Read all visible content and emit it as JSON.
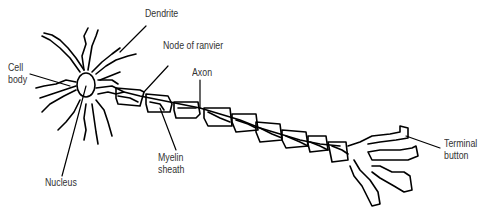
{
  "diagram": {
    "stroke_color": "#000000",
    "text_color": "#333333",
    "background": "#ffffff",
    "labels": {
      "dendrite": "Dendrite",
      "cell_body_line1": "Cell",
      "cell_body_line2": "body",
      "node_of_ranvier": "Node of ranvier",
      "axon": "Axon",
      "myelin_line1": "Myelin",
      "myelin_line2": "sheath",
      "nucleus": "Nucleus",
      "terminal_line1": "Terminal",
      "terminal_line2": "button"
    }
  }
}
